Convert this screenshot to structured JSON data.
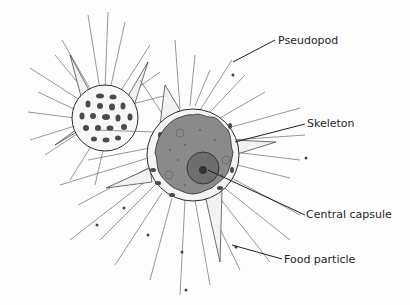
{
  "diagram": {
    "labels": [
      {
        "id": "pseudopod",
        "text": "Pseudopod"
      },
      {
        "id": "skeleton",
        "text": "Skeleton"
      },
      {
        "id": "central-capsule",
        "text": "Central capsule"
      },
      {
        "id": "food-particle",
        "text": "Food particle"
      }
    ],
    "colors": {
      "background": "#fdfdfd",
      "cytoplasm": "#8a8a8a",
      "capsule": "#6e6e6e",
      "skeleton": "#f2f2f2",
      "ink": "#1e1e1e",
      "pseudopod": "#6a6a6a"
    }
  }
}
